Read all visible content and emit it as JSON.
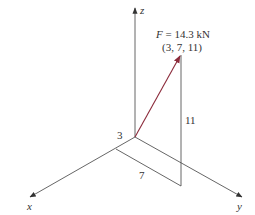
{
  "figure": {
    "axes": {
      "x_label": "x",
      "y_label": "y",
      "z_label": "z"
    },
    "force": {
      "symbol": "F",
      "equals": " = 14.3 kN",
      "magnitude": "14.3",
      "unit": "kN",
      "point_label": "(3, 7, 11)",
      "point": [
        3,
        7,
        11
      ],
      "color": "#8b2a3a"
    },
    "dimensions": {
      "x_component": "3",
      "y_component": "7",
      "z_component": "11"
    },
    "colors": {
      "line": "#555555",
      "text": "#333333",
      "force_arrow": "#8b2a3a"
    }
  }
}
